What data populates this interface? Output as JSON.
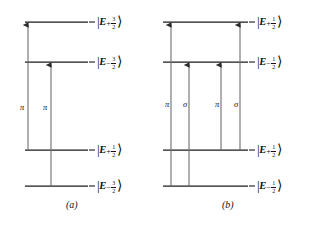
{
  "figure": {
    "background": "#ffffff",
    "line_color": "#1a1a1a",
    "arrow_color": "#4a4a4a"
  },
  "panels": [
    {
      "id": "a",
      "caption": "(a)",
      "levels": [
        {
          "id": "a-l1",
          "label_E": "E",
          "sign": "+",
          "num": "3",
          "den": "2",
          "y": 22,
          "x1": 25,
          "x2": 88
        },
        {
          "id": "a-l2",
          "label_E": "E",
          "sign": "−",
          "num": "3",
          "den": "2",
          "y": 62,
          "x1": 25,
          "x2": 88
        },
        {
          "id": "a-l3",
          "label_E": "E",
          "sign": "+",
          "num": "1",
          "den": "2",
          "y": 150,
          "x1": 25,
          "x2": 88
        },
        {
          "id": "a-l4",
          "label_E": "E",
          "sign": "−",
          "num": "3",
          "den": "2",
          "y": 186,
          "x1": 25,
          "x2": 88
        }
      ],
      "transitions": [
        {
          "id": "a-t1",
          "x": 28,
          "y_from": 150,
          "y_to": 22,
          "label": "π",
          "label_x": 22,
          "label_y": 107
        },
        {
          "id": "a-t2",
          "x": 51,
          "y_from": 186,
          "y_to": 62,
          "label": "π",
          "label_x": 45,
          "label_y": 107
        }
      ]
    },
    {
      "id": "b",
      "caption": "(b)",
      "levels": [
        {
          "id": "b-l1",
          "label_E": "E",
          "sign": "+",
          "num": "1",
          "den": "2",
          "y": 22,
          "x1": 163,
          "x2": 248
        },
        {
          "id": "b-l2",
          "label_E": "E",
          "sign": "−",
          "num": "1",
          "den": "2",
          "y": 62,
          "x1": 163,
          "x2": 248
        },
        {
          "id": "b-l3",
          "label_E": "E",
          "sign": "+",
          "num": "1",
          "den": "2",
          "y": 150,
          "x1": 163,
          "x2": 248
        },
        {
          "id": "b-l4",
          "label_E": "E",
          "sign": "−",
          "num": "1",
          "den": "2",
          "y": 186,
          "x1": 163,
          "x2": 248
        }
      ],
      "transitions": [
        {
          "id": "b-t1",
          "x": 171,
          "y_from": 186,
          "y_to": 22,
          "label": "π",
          "label_x": 165,
          "label_y": 104
        },
        {
          "id": "b-t2",
          "x": 189,
          "y_from": 186,
          "y_to": 62,
          "label": "σ",
          "label_x": 183,
          "label_y": 104
        },
        {
          "id": "b-t3",
          "x": 221,
          "y_from": 150,
          "y_to": 62,
          "label": "π",
          "label_x": 215,
          "label_y": 104
        },
        {
          "id": "b-t4",
          "x": 240,
          "y_from": 150,
          "y_to": 22,
          "label": "σ",
          "label_x": 234,
          "label_y": 104
        }
      ]
    }
  ],
  "captions": [
    {
      "text": "(a)",
      "x": 66,
      "y": 203
    },
    {
      "text": "(b)",
      "x": 222,
      "y": 203
    }
  ]
}
